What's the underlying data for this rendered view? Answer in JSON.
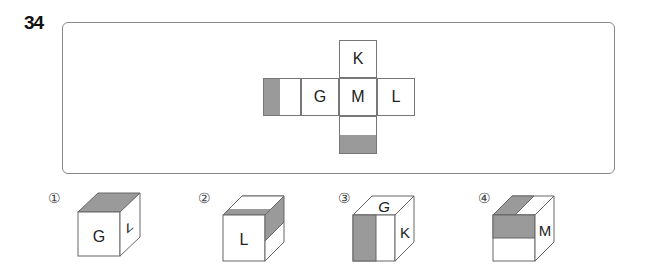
{
  "question": {
    "number": "34"
  },
  "net": {
    "faces": {
      "top": "K",
      "left": "G",
      "center": "M",
      "right": "L",
      "far_left": "",
      "bottom": ""
    },
    "shading_color": "#9a9a9a"
  },
  "options": [
    {
      "label": "①",
      "front": "G",
      "side": "L",
      "top": ""
    },
    {
      "label": "②",
      "front": "L",
      "side": "",
      "top": ""
    },
    {
      "label": "③",
      "front": "",
      "side": "K",
      "top": "G"
    },
    {
      "label": "④",
      "front": "",
      "side": "M",
      "top": ""
    }
  ]
}
